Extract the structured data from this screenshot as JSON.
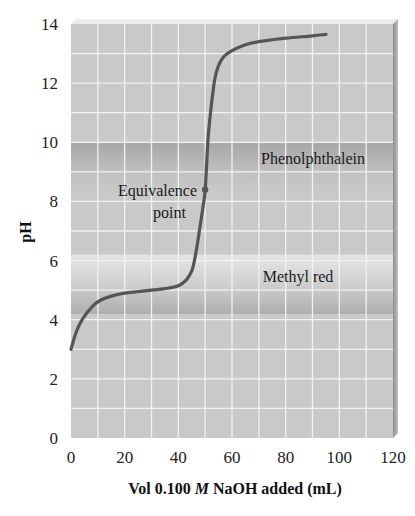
{
  "chart_data": {
    "type": "line",
    "title": "",
    "xlabel": "Vol 0.100 M NaOH added (mL)",
    "xlabel_parts": {
      "prefix": "Vol 0.100 ",
      "italic": "M",
      "suffix": " NaOH added (mL)"
    },
    "ylabel": "pH",
    "xlim": [
      0,
      120
    ],
    "ylim": [
      0,
      14
    ],
    "x_ticks": [
      0,
      20,
      40,
      60,
      80,
      100,
      120
    ],
    "y_ticks": [
      0,
      2,
      4,
      6,
      8,
      10,
      12,
      14
    ],
    "grid": {
      "on": true,
      "x_step": 10,
      "y_step": 1,
      "color": "#f2f2f2"
    },
    "legend": null,
    "series": [
      {
        "name": "Titration curve",
        "color": "#555555",
        "x": [
          0,
          2,
          4.5,
          8,
          10.8,
          15,
          20,
          25,
          30,
          35,
          40,
          43,
          45,
          46,
          47,
          48,
          49,
          50,
          51,
          52,
          53.5,
          55,
          57,
          60,
          65,
          70,
          80,
          90,
          95
        ],
        "y": [
          3.0,
          3.6,
          4.05,
          4.45,
          4.65,
          4.8,
          4.9,
          4.95,
          5.0,
          5.05,
          5.15,
          5.35,
          5.65,
          6.0,
          6.5,
          7.1,
          7.7,
          8.4,
          10.0,
          11.0,
          12.1,
          12.6,
          12.9,
          13.1,
          13.3,
          13.4,
          13.52,
          13.6,
          13.65
        ]
      }
    ],
    "bands": [
      {
        "name": "Phenolphthalein",
        "y_from": 8.2,
        "y_to": 10.0,
        "color_top": "#a6a6a6",
        "color_mid": "#c0c0c0",
        "color_bottom": "#cacaca"
      },
      {
        "name": "Methyl red",
        "y_from": 4.2,
        "y_to": 6.2,
        "color_top": "#e6e6e6",
        "color_mid": "#cfcfcf",
        "color_bottom": "#aeaeae"
      }
    ],
    "annotations": [
      {
        "text_lines": [
          "Equivalence",
          "point"
        ],
        "x": 50,
        "y": 8.4,
        "marker": "dot"
      },
      {
        "text": "Phenolphthalein",
        "x": 91,
        "y": 9.5
      },
      {
        "text": "Methyl red",
        "x": 85,
        "y": 5.5
      }
    ],
    "colors": {
      "plot_bg": "#c9c9c9",
      "frame_edge": "#9a9a9a",
      "curve": "#555555"
    }
  },
  "labels": {
    "phenolphthalein": "Phenolphthalein",
    "methyl_red": "Methyl red",
    "equivalence_line1": "Equivalence",
    "equivalence_line2": "point",
    "y_axis_title": "pH",
    "x_axis_prefix": "Vol 0.100 ",
    "x_axis_italic": "M",
    "x_axis_suffix": " NaOH added (mL)"
  }
}
